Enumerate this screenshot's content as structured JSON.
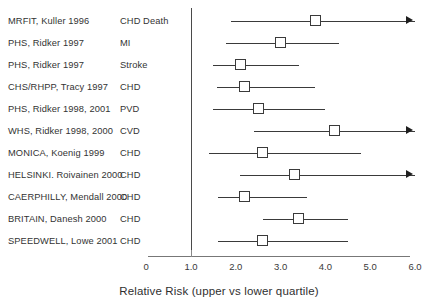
{
  "chart_data": {
    "type": "scatter",
    "title": "",
    "subtitle": "",
    "xlabel": "Relative Risk (upper vs lower quartile)",
    "ylabel": "",
    "xlim": [
      0,
      6.0
    ],
    "grid": false,
    "legend": "none",
    "reference_line": 1.0,
    "x_ticks": [
      {
        "label": "0",
        "value": 0
      },
      {
        "label": "1.0",
        "value": 1.0
      },
      {
        "label": "2.0",
        "value": 2.0
      },
      {
        "label": "3.0",
        "value": 3.0
      },
      {
        "label": "4.0",
        "value": 4.0
      },
      {
        "label": "5.0",
        "value": 5.0
      },
      {
        "label": "6.0",
        "value": 6.0
      }
    ],
    "categories": [
      "MRFIT, Kuller 1996",
      "PHS, Ridker 1997",
      "PHS, Ridker 1997",
      "CHS/RHPP, Tracy 1997",
      "PHS, Ridker 1998, 2001",
      "WHS, Ridker 1998, 2000",
      "MONICA, Koenig 1999",
      "HELSINKI. Roivainen 2000",
      "CAERPHILLY, Mendall 2000",
      "BRITAIN, Danesh 2000",
      "SPEEDWELL, Lowe 2001"
    ],
    "values": [
      3.77,
      3.0,
      2.1,
      2.2,
      2.5,
      4.2,
      2.6,
      3.3,
      2.2,
      3.4,
      2.6
    ],
    "rows": [
      {
        "study": "MRFIT, Kuller 1996",
        "outcome": "CHD Death",
        "estimate": 3.77,
        "ci_low": 1.9,
        "ci_high": 6.0,
        "truncated_high": true
      },
      {
        "study": "PHS, Ridker 1997",
        "outcome": "MI",
        "estimate": 3.0,
        "ci_low": 1.78,
        "ci_high": 4.3,
        "truncated_high": false
      },
      {
        "study": "PHS, Ridker 1997",
        "outcome": "Stroke",
        "estimate": 2.1,
        "ci_low": 1.5,
        "ci_high": 3.4,
        "truncated_high": false
      },
      {
        "study": "CHS/RHPP, Tracy 1997",
        "outcome": "CHD",
        "estimate": 2.2,
        "ci_low": 1.58,
        "ci_high": 3.77,
        "truncated_high": false
      },
      {
        "study": "PHS, Ridker 1998, 2001",
        "outcome": "PVD",
        "estimate": 2.5,
        "ci_low": 1.5,
        "ci_high": 4.0,
        "truncated_high": false
      },
      {
        "study": "WHS, Ridker 1998, 2000",
        "outcome": "CVD",
        "estimate": 4.2,
        "ci_low": 2.4,
        "ci_high": 6.0,
        "truncated_high": true
      },
      {
        "study": "MONICA, Koenig 1999",
        "outcome": "CHD",
        "estimate": 2.6,
        "ci_low": 1.4,
        "ci_high": 4.8,
        "truncated_high": false
      },
      {
        "study": "HELSINKI. Roivainen 2000",
        "outcome": "CHD",
        "estimate": 3.3,
        "ci_low": 2.1,
        "ci_high": 6.0,
        "truncated_high": true
      },
      {
        "study": "CAERPHILLY, Mendall 2000",
        "outcome": "CHD",
        "estimate": 2.2,
        "ci_low": 1.6,
        "ci_high": 3.6,
        "truncated_high": false
      },
      {
        "study": "BRITAIN, Danesh 2000",
        "outcome": "CHD",
        "estimate": 3.4,
        "ci_low": 2.6,
        "ci_high": 4.5,
        "truncated_high": false
      },
      {
        "study": "SPEEDWELL, Lowe 2001",
        "outcome": "CHD",
        "estimate": 2.6,
        "ci_low": 1.6,
        "ci_high": 4.5,
        "truncated_high": false
      }
    ],
    "colors": {
      "line": "#3a3a3a",
      "marker_fill": "#ffffff",
      "marker_stroke": "#3a3a3a",
      "axis": "#777777",
      "reference": "#4a4a4a",
      "text": "#2b2b2b",
      "background": "#ffffff"
    }
  }
}
